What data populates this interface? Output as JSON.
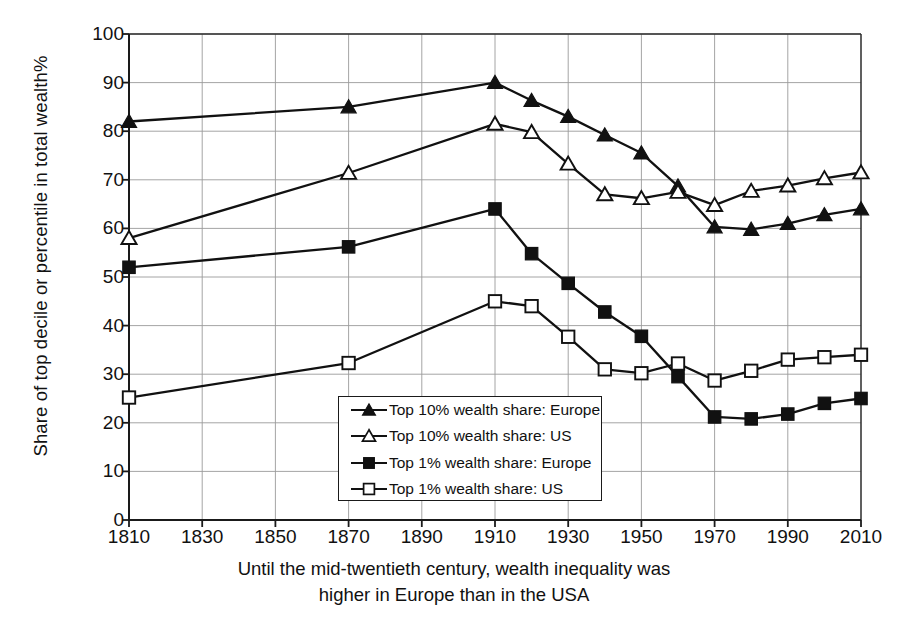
{
  "axes": {
    "ylabel": "Share of top decile or percentile in total wealth%",
    "yticks": [
      "0",
      "10",
      "20",
      "30",
      "40",
      "50",
      "60",
      "70",
      "80",
      "90",
      "100"
    ],
    "xticks": [
      "1810",
      "1830",
      "1850",
      "1870",
      "1890",
      "1910",
      "1930",
      "1950",
      "1970",
      "1990",
      "2010"
    ],
    "ylim": [
      0,
      100
    ],
    "xlim": [
      1810,
      2010
    ]
  },
  "caption": {
    "line1": "Until the mid-twentieth century, wealth inequality was",
    "line2": "higher in Europe than in the USA"
  },
  "legend": [
    {
      "label": "Top 10% wealth share: Europe",
      "marker": "filled-triangle-icon"
    },
    {
      "label": "Top 10% wealth share: US",
      "marker": "open-triangle-icon"
    },
    {
      "label": "Top 1% wealth share: Europe",
      "marker": "filled-square-icon"
    },
    {
      "label": "Top 1% wealth share: US",
      "marker": "open-square-icon"
    }
  ],
  "chart_data": {
    "type": "line",
    "title": "",
    "xlabel": "Until the mid-twentieth century, wealth inequality was higher in Europe than in the USA",
    "ylabel": "Share of top decile or percentile in total wealth%",
    "xlim": [
      1810,
      2010
    ],
    "ylim": [
      0,
      100
    ],
    "ytick_step": 10,
    "xtick_step": 20,
    "grid": true,
    "legend_position": "inside-bottom-center",
    "x": [
      1810,
      1870,
      1910,
      1920,
      1930,
      1940,
      1950,
      1960,
      1970,
      1980,
      1990,
      2000,
      2010
    ],
    "series": [
      {
        "name": "Top 10% wealth share: Europe",
        "marker": "filled-triangle",
        "color": "#111111",
        "values": [
          82,
          85,
          90,
          86.3,
          83,
          79.2,
          75.5,
          68.7,
          60.3,
          59.8,
          61,
          62.8,
          64
        ]
      },
      {
        "name": "Top 10% wealth share: US",
        "marker": "open-triangle",
        "color": "#111111",
        "values": [
          58,
          71.4,
          81.5,
          79.8,
          73.3,
          67,
          66.2,
          67.5,
          64.8,
          67.7,
          68.8,
          70.3,
          71.5
        ]
      },
      {
        "name": "Top 1% wealth share: Europe",
        "marker": "filled-square",
        "color": "#111111",
        "values": [
          52,
          56.2,
          64,
          54.8,
          48.7,
          42.8,
          37.8,
          29.5,
          21.2,
          20.8,
          21.8,
          24,
          25
        ]
      },
      {
        "name": "Top 1% wealth share: US",
        "marker": "open-square",
        "color": "#111111",
        "values": [
          25.2,
          32.3,
          45,
          44,
          37.7,
          31,
          30.2,
          32.2,
          28.7,
          30.7,
          33,
          33.5,
          34
        ]
      }
    ]
  }
}
